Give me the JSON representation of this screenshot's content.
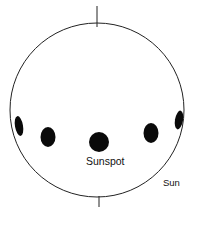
{
  "diagram": {
    "labels": {
      "sunspot": "Sunspot",
      "sun": "Sun"
    },
    "sun_disk": {
      "cx": 97,
      "cy": 110,
      "r": 87,
      "stroke": "#222222",
      "fill": "#ffffff"
    },
    "axis_ticks": [
      {
        "x1": 97,
        "y1": 6,
        "x2": 97,
        "y2": 27
      },
      {
        "x1": 99,
        "y1": 196,
        "x2": 99,
        "y2": 207
      }
    ],
    "sunspots": [
      {
        "cx": 19,
        "cy": 126,
        "rx": 4,
        "ry": 10,
        "rotate": -10
      },
      {
        "cx": 48,
        "cy": 137,
        "rx": 7.5,
        "ry": 10,
        "rotate": 0
      },
      {
        "cx": 99,
        "cy": 142,
        "rx": 10,
        "ry": 10,
        "rotate": 0
      },
      {
        "cx": 151,
        "cy": 133,
        "rx": 7.5,
        "ry": 10,
        "rotate": 0
      },
      {
        "cx": 179,
        "cy": 120,
        "rx": 4,
        "ry": 9.5,
        "rotate": 10
      }
    ],
    "spot_color": "#0a0a0a"
  }
}
